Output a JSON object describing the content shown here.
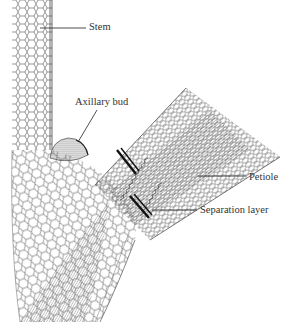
{
  "figure": {
    "type": "botanical-diagram",
    "labels": {
      "stem": "Stem",
      "axillary_bud": "Axillary bud",
      "petiole": "Petiole",
      "separation_layer": "Separation layer"
    },
    "colors": {
      "background": "#ffffff",
      "line": "#333333",
      "separation_layer": "#111111"
    }
  }
}
